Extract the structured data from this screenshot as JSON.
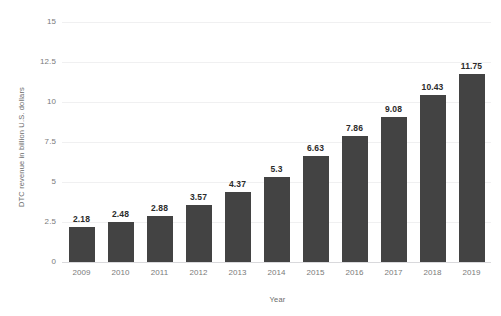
{
  "chart_data": {
    "type": "bar",
    "title": "",
    "subtitle": "",
    "xlabel": "Year",
    "ylabel": "DTC revenue in billion U.S. dollars",
    "categories": [
      "2009",
      "2010",
      "2011",
      "2012",
      "2013",
      "2014",
      "2015",
      "2016",
      "2017",
      "2018",
      "2019"
    ],
    "values": [
      2.18,
      2.48,
      2.88,
      3.57,
      4.37,
      5.3,
      6.63,
      7.86,
      9.08,
      10.43,
      11.75
    ],
    "value_labels": [
      "2.18",
      "2.48",
      "2.88",
      "3.57",
      "4.37",
      "5.3",
      "6.63",
      "7.86",
      "9.08",
      "10.43",
      "11.75"
    ],
    "ylim": [
      0,
      15
    ],
    "ytick_values": [
      0,
      2.5,
      5,
      7.5,
      10,
      12.5,
      15
    ],
    "ytick_labels": [
      "0",
      "2.5",
      "5",
      "7.5",
      "10",
      "12.5",
      "15"
    ],
    "grid": true,
    "grid_axis": "y",
    "legend": false,
    "legend_position": "none",
    "bar_color": "#434343",
    "grid_color": "#f0f0f1",
    "baseline_color": "#d9d9dc",
    "label_color": "#2b2b2b",
    "tick_color": "#7a7a7a",
    "background_color": "#ffffff"
  }
}
